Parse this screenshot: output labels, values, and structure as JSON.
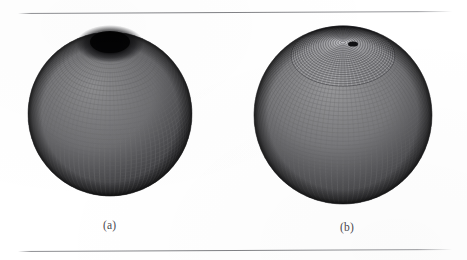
{
  "figure": {
    "background_color": "#ffffff",
    "rule_color": "#7e7f83",
    "ink_color": "#1a1a1a",
    "caption_color": "#4a4a4e",
    "panels": [
      {
        "id": "a",
        "caption": "(a)",
        "mesh_kind": "latitude-longitude-grid",
        "description": "sphere tessellated with a structured quadrilateral latitude-longitude mesh; elements cluster and degenerate into a dense dark patch at the visible pole",
        "center_x": 110,
        "center_y": 114,
        "radius": 82,
        "pole_x": 110,
        "pole_y": 40,
        "meridian_count": 96,
        "parallel_count": 52,
        "pole_cap_darkness": 0.97
      },
      {
        "id": "b",
        "caption": "(b)",
        "mesh_kind": "radial-spoke-polar-cap-grid",
        "description": "sphere tessellated with a radial spoke mesh whose spokes converge at a single pole point, surrounded by concentric rings blending into a quadrilateral grid toward the equator",
        "center_x": 343,
        "center_y": 115,
        "radius": 89,
        "pole_x": 353,
        "pole_y": 44,
        "spoke_count": 72,
        "ring_count": 22,
        "meridian_count": 96,
        "parallel_count": 52,
        "pole_cap_darkness": 0.45
      }
    ]
  },
  "chart_data": {
    "type": "scatter",
    "title": "",
    "xlabel": "",
    "ylabel": "",
    "series": [
      {
        "name": "(a) latitude-longitude spherical mesh",
        "meridians": 96,
        "parallels": 52,
        "pole_singularity": "degenerate dense cluster"
      },
      {
        "name": "(b) radial polar-cap spherical mesh",
        "spokes": 72,
        "rings": 22,
        "pole_singularity": "single convergent point"
      }
    ]
  }
}
